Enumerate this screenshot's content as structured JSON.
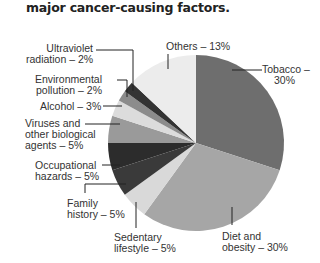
{
  "title": "major cancer-causing factors.",
  "chart_data": {
    "type": "pie",
    "title": "major cancer-causing factors.",
    "categories": [
      "Tobacco",
      "Diet and obesity",
      "Sedentary lifestyle",
      "Family history",
      "Occupational hazards",
      "Viruses and other biological agents",
      "Alcohol",
      "Environmental pollution",
      "Ultraviolet radiation",
      "Others"
    ],
    "values": [
      30,
      30,
      5,
      5,
      5,
      5,
      3,
      2,
      2,
      13
    ],
    "units": "%",
    "colors": [
      "#6e6e6e",
      "#a6a6a6",
      "#d9d9d9",
      "#3a3a3a",
      "#2c2c2c",
      "#9a9a9a",
      "#dcdcdc",
      "#8c8c8c",
      "#333333",
      "#ececec"
    ],
    "start_angle": "12 o'clock",
    "direction": "clockwise",
    "legend": "callout labels"
  },
  "labels": {
    "tobacco": [
      "Tobacco –",
      "30%"
    ],
    "diet": [
      "Diet and",
      "obesity – 30%"
    ],
    "sedentary": [
      "Sedentary",
      "lifestyle – 5%"
    ],
    "family": [
      "Family",
      "history – 5%"
    ],
    "occupational": [
      "Occupational",
      "hazards – 5%"
    ],
    "viruses": [
      "Viruses and",
      "other biological",
      "agents – 5%"
    ],
    "alcohol": [
      "Alcohol – 3%"
    ],
    "environmental": [
      "Environmental",
      "pollution – 2%"
    ],
    "uv": [
      "Ultraviolet",
      "radiation – 2%"
    ],
    "others": [
      "Others – 13%"
    ]
  }
}
